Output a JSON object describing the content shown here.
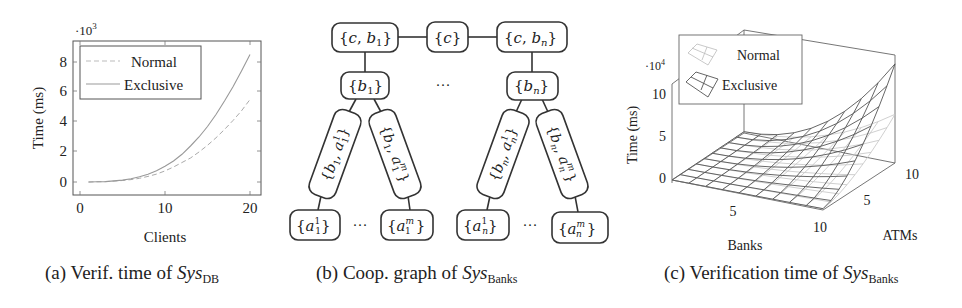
{
  "figures": [
    {
      "id": "a",
      "caption": {
        "prefix": "(a)",
        "text": "Verif. time of",
        "sys": "Sys",
        "sub": "DB"
      }
    },
    {
      "id": "b",
      "caption": {
        "prefix": "(b)",
        "text": "Coop. graph of",
        "sys": "Sys",
        "sub": "Banks"
      }
    },
    {
      "id": "c",
      "caption": {
        "prefix": "(c)",
        "text": "Verification time of",
        "sys": "Sys",
        "sub": "Banks"
      }
    }
  ],
  "chart_data": [
    {
      "type": "line",
      "title": "Verif. time of SysDB",
      "xlabel": "Clients",
      "ylabel": "Time (ms)",
      "y_multiplier": "·10^3",
      "xlim": [
        0,
        22
      ],
      "ylim": [
        -1,
        9.5
      ],
      "xticks": [
        "0",
        "10",
        "20"
      ],
      "yticks": [
        "0",
        "2",
        "4",
        "6",
        "8"
      ],
      "grid": false,
      "legend_position": "upper left",
      "x": [
        1,
        2,
        3,
        4,
        5,
        6,
        7,
        8,
        9,
        10,
        11,
        12,
        13,
        14,
        15,
        16,
        17,
        18,
        19,
        20
      ],
      "series": [
        {
          "name": "Normal",
          "style": "dashed",
          "values": [
            0.0,
            0.01,
            0.03,
            0.06,
            0.1,
            0.16,
            0.25,
            0.37,
            0.53,
            0.74,
            1.0,
            1.3,
            1.6,
            2.0,
            2.45,
            2.95,
            3.5,
            4.1,
            4.75,
            5.5
          ]
        },
        {
          "name": "Exclusive",
          "style": "solid",
          "values": [
            0.0,
            0.01,
            0.03,
            0.07,
            0.13,
            0.22,
            0.35,
            0.52,
            0.75,
            1.05,
            1.4,
            1.85,
            2.4,
            3.0,
            3.7,
            4.5,
            5.4,
            6.35,
            7.4,
            8.5
          ]
        }
      ],
      "legend": [
        "Normal",
        "Exclusive"
      ]
    },
    {
      "type": "diagram",
      "title": "Coop. graph of SysBanks",
      "nodes": [
        {
          "id": "cb1",
          "label": "{c, b1}"
        },
        {
          "id": "c",
          "label": "{c}"
        },
        {
          "id": "cbn",
          "label": "{c, bn}"
        },
        {
          "id": "b1",
          "label": "{b1}"
        },
        {
          "id": "bn",
          "label": "{bn}"
        },
        {
          "id": "b1a11",
          "label": "{b1, a1^1}"
        },
        {
          "id": "b1a1m",
          "label": "{b1, a1^m}"
        },
        {
          "id": "bnan1",
          "label": "{bn, an^1}"
        },
        {
          "id": "bnanm",
          "label": "{bn, an^m}"
        },
        {
          "id": "a11",
          "label": "{a1^1}"
        },
        {
          "id": "a1m",
          "label": "{a1^m}"
        },
        {
          "id": "an1",
          "label": "{an^1}"
        },
        {
          "id": "anm",
          "label": "{an^m}"
        }
      ],
      "edges": [
        [
          "cb1",
          "c"
        ],
        [
          "c",
          "cbn"
        ],
        [
          "cb1",
          "b1"
        ],
        [
          "cbn",
          "bn"
        ],
        [
          "b1",
          "b1a11"
        ],
        [
          "b1",
          "b1a1m"
        ],
        [
          "bn",
          "bnan1"
        ],
        [
          "bn",
          "bnanm"
        ],
        [
          "b1a11",
          "a11"
        ],
        [
          "b1a1m",
          "a1m"
        ],
        [
          "bnan1",
          "an1"
        ],
        [
          "bnanm",
          "anm"
        ]
      ],
      "ellipsis": "···"
    },
    {
      "type": "surface3d",
      "title": "Verification time of SysBanks",
      "xlabel": "Banks",
      "ylabel": "ATMs",
      "zlabel": "Time (ms)",
      "z_multiplier": "·10^4",
      "xticks": [
        "5",
        "10"
      ],
      "yticks": [
        "5",
        "10"
      ],
      "zticks": [
        "0",
        "5",
        "10"
      ],
      "xlim": [
        1,
        10
      ],
      "ylim": [
        1,
        10
      ],
      "zlim": [
        0,
        12
      ],
      "grid_size": 10,
      "series": [
        {
          "name": "Normal",
          "style": "light",
          "peak_at_10_10": 5.5
        },
        {
          "name": "Exclusive",
          "style": "dark",
          "peak_at_10_10": 11.5
        }
      ],
      "legend": [
        "Normal",
        "Exclusive"
      ],
      "legend_position": "upper left"
    }
  ],
  "labels": {
    "a": {
      "mult_base": "·10",
      "mult_exp": "3",
      "ylabel": "Time (ms)",
      "xlabel": "Clients",
      "yticks": [
        "8",
        "6",
        "4",
        "2",
        "0"
      ],
      "xticks": [
        "0",
        "10",
        "20"
      ],
      "legend_normal": "Normal",
      "legend_exclusive": "Exclusive"
    },
    "b": {
      "cb1_a": "{",
      "cb1_c": "c",
      "cb1_comma": ", ",
      "cb1_b": "b",
      "cb1_sub": "1",
      "cb1_z": "}",
      "c_label": "{c}",
      "cbn_b": "b",
      "cbn_sub": "n",
      "b1_sub": "1",
      "bn_sub": "n",
      "dots": "···",
      "r1": "{b",
      "r1sub": "1",
      "r1mid": ", a",
      "r1sup": "1",
      "r1sub2": "1",
      "r1end": "}",
      "r2sup": "m",
      "r3sub": "n",
      "a_sup1": "1",
      "a_supm": "m",
      "a_sub1": "1",
      "a_subn": "n"
    },
    "c": {
      "mult_base": "·10",
      "mult_exp": "4",
      "zlabel": "Time (ms)",
      "xlabel": "Banks",
      "ylabel": "ATMs",
      "zticks": [
        "10",
        "5",
        "0"
      ],
      "xticks": [
        "5",
        "10"
      ],
      "yticks": [
        "5",
        "10"
      ],
      "legend_normal": "Normal",
      "legend_exclusive": "Exclusive"
    }
  }
}
